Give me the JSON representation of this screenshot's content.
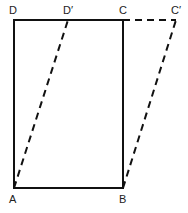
{
  "diagram": {
    "points": {
      "A": {
        "label": "A",
        "x": 14,
        "y": 188
      },
      "B": {
        "label": "B",
        "x": 123,
        "y": 188
      },
      "C": {
        "label": "C",
        "x": 123,
        "y": 20
      },
      "D": {
        "label": "D",
        "x": 14,
        "y": 20
      },
      "D_prime": {
        "label": "D′",
        "x": 68,
        "y": 20
      },
      "C_prime": {
        "label": "C′",
        "x": 176,
        "y": 20
      }
    },
    "solid_shape": "rectangle ABCD",
    "dashed_shape": "parallelogram ABC′D′",
    "stroke_color": "#111111"
  }
}
